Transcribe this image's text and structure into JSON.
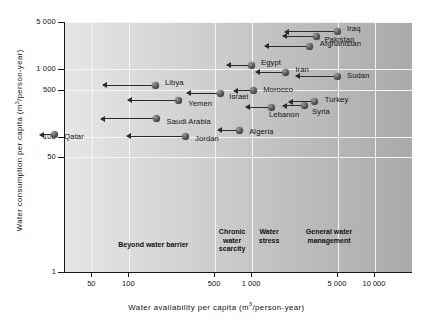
{
  "chart_data": {
    "type": "scatter",
    "title": "",
    "xlabel": "Water availability per capita (m³/person-year)",
    "ylabel": "Water consumption per capita (m³/person-year)",
    "xscale": "log",
    "yscale": "log",
    "xlim": [
      30,
      20000
    ],
    "ylim": [
      1,
      5000
    ],
    "grid": true,
    "legend": "none",
    "xticks": [
      {
        "value": 50,
        "label": "50"
      },
      {
        "value": 100,
        "label": "100"
      },
      {
        "value": 500,
        "label": "500"
      },
      {
        "value": 1000,
        "label": "1 000"
      },
      {
        "value": 5000,
        "label": "5 000"
      },
      {
        "value": 10000,
        "label": "10 000"
      }
    ],
    "yticks": [
      {
        "value": 5000,
        "label": "5 000"
      },
      {
        "value": 1000,
        "label": "1 000"
      },
      {
        "value": 500,
        "label": "500"
      },
      {
        "value": 100,
        "label": "100"
      },
      {
        "value": 50,
        "label": "50"
      },
      {
        "value": 1,
        "label": "1"
      }
    ],
    "points": [
      {
        "name": "Iraq",
        "x": 5000,
        "y": 3600,
        "arrow_to_x": 1900,
        "label_side": "right",
        "label_dx": 6,
        "label_dy": -4
      },
      {
        "name": "Pakistan",
        "x": 3400,
        "y": 3100,
        "arrow_to_x": 1800,
        "label_side": "right",
        "label_dx": 4,
        "label_dy": 3
      },
      {
        "name": "Afghanistan",
        "x": 3000,
        "y": 2200,
        "arrow_to_x": 1300,
        "label_side": "right",
        "label_dx": 6,
        "label_dy": -3
      },
      {
        "name": "Egypt",
        "x": 1000,
        "y": 1150,
        "arrow_to_x": 640,
        "label_side": "right",
        "label_dx": 6,
        "label_dy": -3
      },
      {
        "name": "Iran",
        "x": 1900,
        "y": 900,
        "arrow_to_x": 1100,
        "label_side": "right",
        "label_dx": 6,
        "label_dy": -3
      },
      {
        "name": "Sudan",
        "x": 5000,
        "y": 790,
        "arrow_to_x": 2300,
        "label_side": "right",
        "label_dx": 6,
        "label_dy": -1
      },
      {
        "name": "Libya",
        "x": 165,
        "y": 580,
        "arrow_to_x": 62,
        "label_side": "right",
        "label_dx": 6,
        "label_dy": -3
      },
      {
        "name": "Morocco",
        "x": 1040,
        "y": 480,
        "arrow_to_x": 720,
        "label_side": "right",
        "label_dx": 6,
        "label_dy": -2
      },
      {
        "name": "Israel",
        "x": 560,
        "y": 440,
        "arrow_to_x": 300,
        "label_side": "right",
        "label_dx": 5,
        "label_dy": 3
      },
      {
        "name": "Yemen",
        "x": 255,
        "y": 350,
        "arrow_to_x": 100,
        "label_side": "right",
        "label_dx": 6,
        "label_dy": 3
      },
      {
        "name": "Turkey",
        "x": 3300,
        "y": 330,
        "arrow_to_x": 2050,
        "label_side": "right",
        "label_dx": 6,
        "label_dy": -3
      },
      {
        "name": "Syria",
        "x": 2700,
        "y": 290,
        "arrow_to_x": 1800,
        "label_side": "right",
        "label_dx": 4,
        "label_dy": 5
      },
      {
        "name": "Lebanon",
        "x": 1450,
        "y": 275,
        "arrow_to_x": 900,
        "label_side": "right",
        "label_dx": -6,
        "label_dy": 7
      },
      {
        "name": "Saudi Arabia",
        "x": 170,
        "y": 185,
        "arrow_to_x": 60,
        "label_side": "right",
        "label_dx": 6,
        "label_dy": 2
      },
      {
        "name": "Algeria",
        "x": 800,
        "y": 125,
        "arrow_to_x": 540,
        "label_side": "right",
        "label_dx": 6,
        "label_dy": 1
      },
      {
        "name": "Qatar",
        "x": 25,
        "y": 108,
        "arrow_to_x": 19,
        "label_side": "right",
        "label_dx": 6,
        "label_dy": 1
      },
      {
        "name": "Jordan",
        "x": 290,
        "y": 103,
        "arrow_to_x": 98,
        "label_side": "right",
        "label_dx": 6,
        "label_dy": 2
      }
    ],
    "zones": [
      {
        "label": "Beyond water barrier",
        "x_center": 160,
        "multiline": false
      },
      {
        "label": "Chronic\nwater\nscarcity",
        "x_center": 700,
        "multiline": true
      },
      {
        "label": "Water\nstress",
        "x_center": 1400,
        "multiline": true
      },
      {
        "label": "General water\nmanagement",
        "x_center": 4300,
        "multiline": true
      }
    ]
  }
}
